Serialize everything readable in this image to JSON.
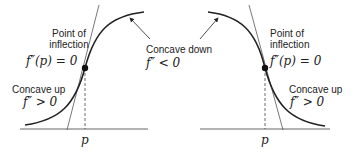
{
  "left_panel": {
    "inflection_label_line1": "Point of",
    "inflection_label_line2": "inflection",
    "inflection_condition": "f″(p) = 0",
    "concave_up_label": "Concave up",
    "concave_up_condition": "f″ > 0",
    "axis_label": "p"
  },
  "center": {
    "concave_down_label": "Concave down",
    "concave_down_condition": "f″ < 0"
  },
  "right_panel": {
    "inflection_label_line1": "Point of",
    "inflection_label_line2": "inflection",
    "inflection_condition": "f″(p) = 0",
    "concave_up_label": "Concave up",
    "concave_up_condition": "f″ > 0",
    "axis_label": "p"
  },
  "colors": {
    "curve": "#222222",
    "tangent": "#555555",
    "axis": "#666666"
  }
}
